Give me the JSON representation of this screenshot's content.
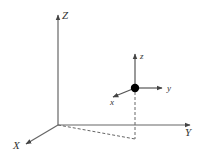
{
  "diagram": {
    "title": "",
    "colors": {
      "line": "#555555",
      "text": "#333333",
      "point": "#000000",
      "background": "#ffffff"
    },
    "world_frame": {
      "labels": {
        "x": "X",
        "y": "Y",
        "z": "Z"
      }
    },
    "body_frame": {
      "labels": {
        "x": "x",
        "y": "y",
        "z": "z"
      }
    },
    "projection": {
      "style": "dashed",
      "description": "point projected to XY plane"
    }
  }
}
